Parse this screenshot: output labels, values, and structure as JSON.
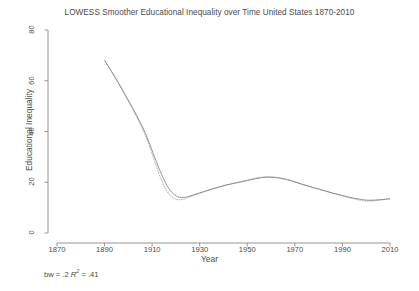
{
  "chart_data": {
    "type": "line",
    "title": "LOWESS Smoother Educational Inequality over Time United States 1870-2010",
    "xlabel": "Year",
    "ylabel": "Educational Inequality",
    "annotation": "bw = .2 R² = .41",
    "annotation_parts": {
      "bw_text": "bw = .2 ",
      "r_symbol": "R",
      "r_exponent": "2",
      "r_value": " = .41"
    },
    "xlim": [
      1870,
      2010
    ],
    "ylim": [
      0,
      80
    ],
    "xticks": [
      1870,
      1890,
      1910,
      1930,
      1950,
      1970,
      1990,
      2010
    ],
    "yticks": [
      0,
      20,
      40,
      60,
      80
    ],
    "xtick_labels": [
      "1870",
      "1890",
      "1910",
      "1930",
      "1950",
      "1970",
      "1990",
      "2010"
    ],
    "ytick_labels": [
      "0",
      "20",
      "40",
      "60",
      "80"
    ],
    "grid": false,
    "legend": "none",
    "line_color": "#7a7a7a",
    "axis_color": "#8a8a8a",
    "series": [
      {
        "name": "lowess-smooth",
        "style": "solid",
        "x": [
          1890,
          1893,
          1896,
          1899,
          1902,
          1905,
          1908,
          1911,
          1914,
          1917,
          1920,
          1923,
          1926,
          1929,
          1932,
          1935,
          1938,
          1941,
          1944,
          1947,
          1950,
          1953,
          1956,
          1959,
          1962,
          1965,
          1968,
          1971,
          1974,
          1977,
          1980,
          1983,
          1986,
          1989,
          1992,
          1995,
          1998,
          2001,
          2004,
          2007,
          2010
        ],
        "y": [
          68.0,
          63.6,
          58.9,
          54.0,
          48.9,
          43.6,
          37.4,
          30.0,
          23.0,
          17.6,
          14.6,
          14.0,
          14.6,
          15.5,
          16.4,
          17.3,
          18.1,
          18.9,
          19.5,
          20.1,
          20.7,
          21.3,
          21.8,
          22.0,
          21.8,
          21.4,
          20.7,
          19.8,
          18.9,
          18.1,
          17.3,
          16.5,
          15.7,
          15.0,
          14.3,
          13.7,
          13.2,
          12.9,
          13.0,
          13.2,
          13.5
        ]
      },
      {
        "name": "lowess-secondary",
        "style": "dotted",
        "x": [
          1890,
          1893,
          1896,
          1899,
          1902,
          1905,
          1908,
          1911,
          1914,
          1917,
          1920,
          1923,
          1926,
          1929,
          1932,
          1935,
          1938,
          1941,
          1944,
          1947,
          1950,
          1953,
          1956,
          1959,
          1962,
          1965,
          1968,
          1971,
          1974,
          1977,
          1980,
          1983,
          1986,
          1989,
          1992,
          1995,
          1998,
          2001,
          2004,
          2007,
          2010
        ],
        "y": [
          68.0,
          63.4,
          58.6,
          53.6,
          48.4,
          42.9,
          36.4,
          28.4,
          20.6,
          15.4,
          13.3,
          13.3,
          14.3,
          15.3,
          16.3,
          17.2,
          18.0,
          18.8,
          19.5,
          20.1,
          20.8,
          21.5,
          22.0,
          22.2,
          22.0,
          21.5,
          20.8,
          19.9,
          19.0,
          18.1,
          17.3,
          16.5,
          15.7,
          14.9,
          14.1,
          13.4,
          12.8,
          12.6,
          12.8,
          13.1,
          13.4
        ]
      }
    ]
  }
}
